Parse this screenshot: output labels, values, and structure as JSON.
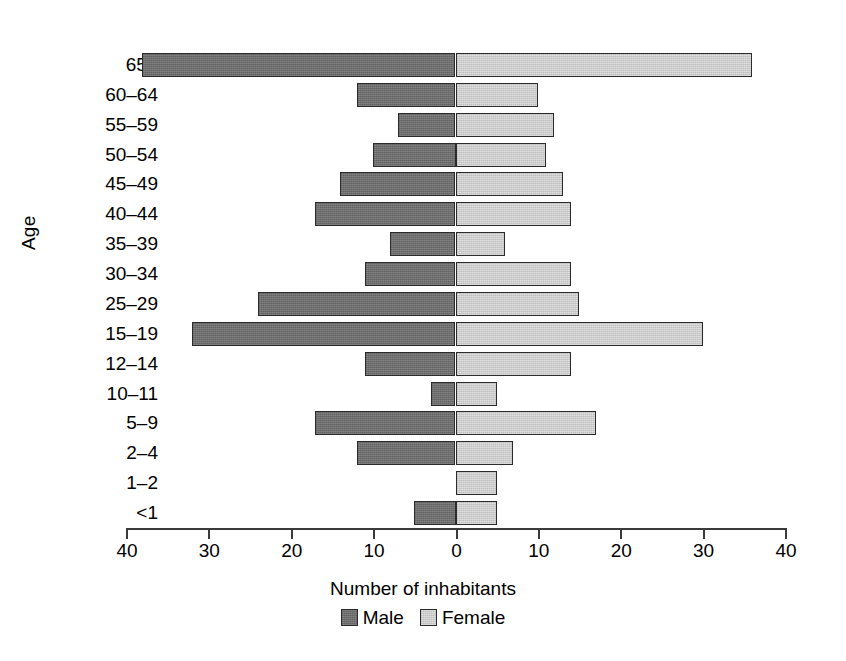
{
  "chart_data": {
    "type": "bar",
    "subtype": "population-pyramid",
    "title": "",
    "xlabel": "Number of inhabitants",
    "ylabel": "Age",
    "orientation": "horizontal",
    "grid": false,
    "legend_position": "bottom-center",
    "xlim": [
      -40,
      40
    ],
    "xticks": [
      -40,
      -30,
      -20,
      -10,
      0,
      10,
      20,
      30,
      40
    ],
    "xtick_labels": [
      "40",
      "30",
      "20",
      "10",
      "0",
      "10",
      "20",
      "30",
      "40"
    ],
    "categories": [
      "65+",
      "60–64",
      "55–59",
      "50–54",
      "45–49",
      "40–44",
      "35–39",
      "30–34",
      "25–29",
      "15–19",
      "12–14",
      "10–11",
      "5–9",
      "2–4",
      "1–2",
      "<1"
    ],
    "series": [
      {
        "name": "Male",
        "side": "left",
        "color": "#6e6e6e",
        "values": [
          38,
          12,
          7,
          10,
          14,
          17,
          8,
          11,
          24,
          32,
          11,
          3,
          17,
          12,
          0,
          5
        ]
      },
      {
        "name": "Female",
        "side": "right",
        "color": "#cdcdcd",
        "values": [
          36,
          10,
          12,
          11,
          13,
          14,
          6,
          14,
          15,
          30,
          14,
          5,
          17,
          7,
          5,
          5
        ]
      }
    ]
  },
  "axes": {
    "y_title": "Age",
    "x_title": "Number of inhabitants"
  },
  "legend": {
    "entries": [
      {
        "label": "Male",
        "swatch": "male-swatch"
      },
      {
        "label": "Female",
        "swatch": "female-swatch"
      }
    ]
  }
}
